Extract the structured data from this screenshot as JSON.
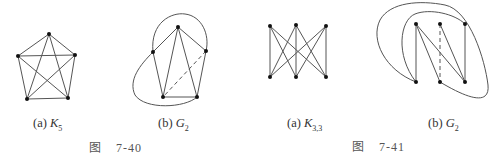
{
  "figures": [
    {
      "caption": {
        "prefix": "图",
        "number": "7-40"
      },
      "subfigures": [
        {
          "id": "a",
          "label_prefix": "(a)",
          "label_symbol": "K",
          "label_sub": "5",
          "graph": "complete graph on 5 vertices"
        },
        {
          "id": "b",
          "label_prefix": "(b)",
          "label_symbol": "G",
          "label_sub": "2",
          "graph": "K5 drawn with curved edges and one dashed edge"
        }
      ]
    },
    {
      "caption": {
        "prefix": "图",
        "number": "7-41"
      },
      "subfigures": [
        {
          "id": "a",
          "label_prefix": "(a)",
          "label_symbol": "K",
          "label_sub": "3,3",
          "graph": "complete bipartite graph K3,3"
        },
        {
          "id": "b",
          "label_prefix": "(b)",
          "label_symbol": "G",
          "label_sub": "2",
          "graph": "K3,3 drawn with curved edges and one dashed edge"
        }
      ]
    }
  ],
  "colors": {
    "edge": "#555555",
    "vertex": "#111111",
    "text": "#333333"
  }
}
